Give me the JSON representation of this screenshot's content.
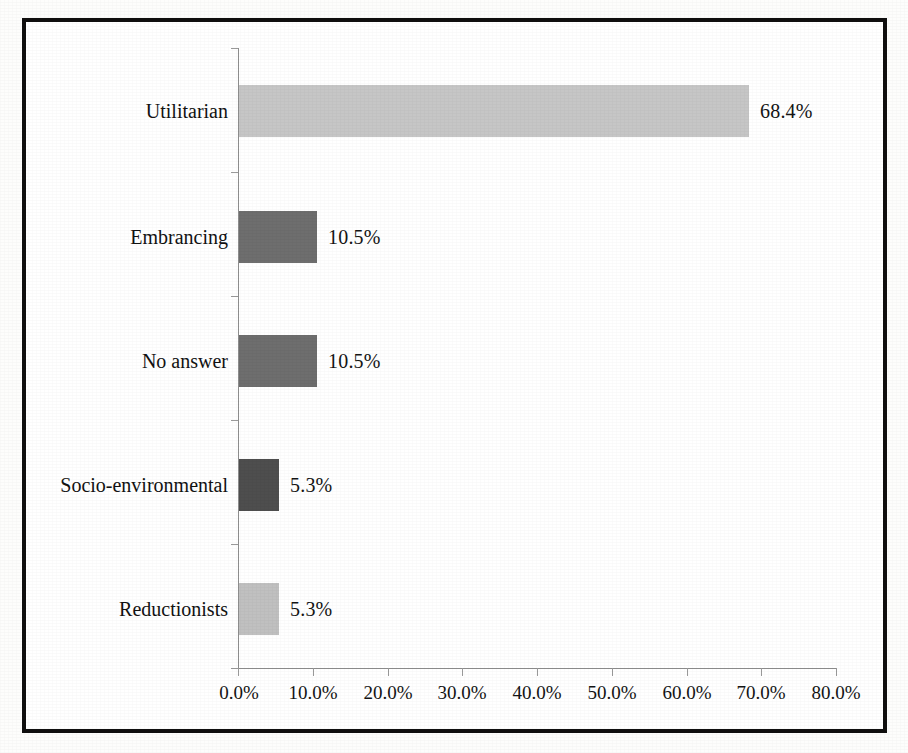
{
  "chart_data": {
    "type": "bar",
    "orientation": "horizontal",
    "title": "",
    "subtitle": "",
    "xlabel": "",
    "ylabel": "",
    "categories": [
      "Utilitarian",
      "Embrancing",
      "No answer",
      "Socio-environmental",
      "Reductionists"
    ],
    "values": [
      68.4,
      10.5,
      10.5,
      5.3,
      5.3
    ],
    "data_labels": [
      "68.4%",
      "10.5%",
      "10.5%",
      "5.3%",
      "5.3%"
    ],
    "bar_colors": [
      "#c6c6c6",
      "#6e6e6e",
      "#6e6e6e",
      "#4e4e4e",
      "#c0c0c0"
    ],
    "xlim": [
      0,
      80
    ],
    "x_tick_values": [
      0,
      10,
      20,
      30,
      40,
      50,
      60,
      70,
      80
    ],
    "x_tick_labels": [
      "0.0%",
      "10.0%",
      "20.0%",
      "30.0%",
      "40.0%",
      "50.0%",
      "60.0%",
      "70.0%",
      "80.0%"
    ],
    "grid": false,
    "legend": "none",
    "frame_color": "#100f0f",
    "axis_color": "#8d8d8d",
    "text_color": "#141414",
    "background": "#ffffff"
  },
  "bars": [
    {
      "label": "Utilitarian",
      "value": 68.4,
      "value_label": "68.4%",
      "color": "#c6c6c6"
    },
    {
      "label": "Embrancing",
      "value": 10.5,
      "value_label": "10.5%",
      "color": "#6e6e6e"
    },
    {
      "label": "No answer",
      "value": 10.5,
      "value_label": "10.5%",
      "color": "#6e6e6e"
    },
    {
      "label": "Socio-environmental",
      "value": 5.3,
      "value_label": "5.3%",
      "color": "#4e4e4e"
    },
    {
      "label": "Reductionists",
      "value": 5.3,
      "value_label": "5.3%",
      "color": "#c0c0c0"
    }
  ],
  "x_axis": {
    "ticks": [
      {
        "label": "0.0%",
        "value": 0
      },
      {
        "label": "10.0%",
        "value": 10
      },
      {
        "label": "20.0%",
        "value": 20
      },
      {
        "label": "30.0%",
        "value": 30
      },
      {
        "label": "40.0%",
        "value": 40
      },
      {
        "label": "50.0%",
        "value": 50
      },
      {
        "label": "60.0%",
        "value": 60
      },
      {
        "label": "70.0%",
        "value": 70
      },
      {
        "label": "80.0%",
        "value": 80
      }
    ]
  }
}
